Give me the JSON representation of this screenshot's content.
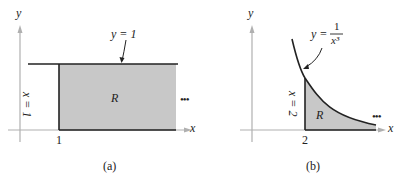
{
  "panels": [
    {
      "id": "a",
      "caption": "(a)",
      "y_axis": "y",
      "x_axis": "x",
      "curve_label": "y = 1",
      "vertical_label": "x = 1",
      "region_label": "R",
      "tick_label": "1",
      "continuation": "•••"
    },
    {
      "id": "b",
      "caption": "(b)",
      "y_axis": "y",
      "x_axis": "x",
      "curve_label_lhs": "y =",
      "curve_label_num": "1",
      "curve_label_den": "x³",
      "vertical_label": "x = 2",
      "region_label": "R",
      "tick_label": "2",
      "continuation": "•••"
    }
  ],
  "colors": {
    "region_fill": "#c8c8c8",
    "axis": "#b0b0b0",
    "line": "#222222"
  }
}
